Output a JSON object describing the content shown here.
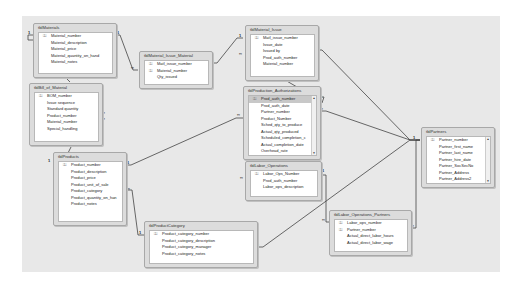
{
  "diagram": {
    "colors": {
      "background": "#e8e8e8",
      "table_frame": "#dcdcdc",
      "table_body": "#ffffff",
      "line": "#444444",
      "selected_field": "#c8c8c8"
    },
    "tables": [
      {
        "id": "tblMaterials",
        "title": "tblMaterials",
        "fields": [
          {
            "name": "Material_number",
            "pk": true
          },
          {
            "name": "Material_description",
            "pk": false
          },
          {
            "name": "Material_price",
            "pk": false
          },
          {
            "name": "Material_quantity_on_hand",
            "pk": false
          },
          {
            "name": "Material_notes",
            "pk": false
          }
        ]
      },
      {
        "id": "tblMaterial_Issue_Material",
        "title": "tblMaterial_Issue_Material",
        "fields": [
          {
            "name": "Matl_issue_number",
            "pk": true
          },
          {
            "name": "Material_number",
            "pk": true
          },
          {
            "name": "Qty_issued",
            "pk": false
          }
        ]
      },
      {
        "id": "tblMaterial_Issue",
        "title": "tblMaterial_Issue",
        "fields": [
          {
            "name": "Matl_issue_number",
            "pk": true
          },
          {
            "name": "Issue_date",
            "pk": false
          },
          {
            "name": "Issued by",
            "pk": false
          },
          {
            "name": "Prod_auth_number",
            "pk": false
          },
          {
            "name": "Material_number",
            "pk": false
          }
        ]
      },
      {
        "id": "tblBill_of_Material",
        "title": "tblBill_of_Material",
        "fields": [
          {
            "name": "BOM_number",
            "pk": true
          },
          {
            "name": "Issue sequence",
            "pk": false
          },
          {
            "name": "Standard quantity",
            "pk": false
          },
          {
            "name": "Product_number",
            "pk": false
          },
          {
            "name": "Material_number",
            "pk": false
          },
          {
            "name": "Special_handling",
            "pk": false
          }
        ]
      },
      {
        "id": "tblProduction_Authorizations",
        "title": "tblProduction_Authorizations",
        "scrollable": true,
        "fields": [
          {
            "name": "Prod_auth_number",
            "pk": true,
            "selected": true
          },
          {
            "name": "Prod_auth_date",
            "pk": false
          },
          {
            "name": "Partner_number",
            "pk": false
          },
          {
            "name": "Product_Number",
            "pk": false
          },
          {
            "name": "Sched_qty_to_produce",
            "pk": false
          },
          {
            "name": "Actual_qty_produced",
            "pk": false
          },
          {
            "name": "Scheduled_completion_c",
            "pk": false
          },
          {
            "name": "Actual_completion_date",
            "pk": false
          },
          {
            "name": "Overhead_rate",
            "pk": false
          }
        ]
      },
      {
        "id": "tblProducts",
        "title": "tblProducts",
        "fields": [
          {
            "name": "Product_number",
            "pk": true
          },
          {
            "name": "Product_description",
            "pk": false
          },
          {
            "name": "Product_price",
            "pk": false
          },
          {
            "name": "Product_unit_of_sale",
            "pk": false
          },
          {
            "name": "Product_category",
            "pk": false
          },
          {
            "name": "Product_quantity_on_han",
            "pk": false
          },
          {
            "name": "Product_notes",
            "pk": false
          }
        ]
      },
      {
        "id": "tblLabor_Operations",
        "title": "tblLabor_Operations",
        "fields": [
          {
            "name": "Labor_Ops_Number",
            "pk": true
          },
          {
            "name": "Prod_auth_number",
            "pk": false
          },
          {
            "name": "Labor_ops_description",
            "pk": false
          }
        ]
      },
      {
        "id": "tblPartners",
        "title": "tblPartners",
        "scrollable": true,
        "fields": [
          {
            "name": "Partner_number",
            "pk": true
          },
          {
            "name": "Partner_first_name",
            "pk": false
          },
          {
            "name": "Partner_last_name",
            "pk": false
          },
          {
            "name": "Partner_hire_date",
            "pk": false
          },
          {
            "name": "Partner_SocSecNo",
            "pk": false
          },
          {
            "name": "Partner_Address",
            "pk": false
          },
          {
            "name": "Partner_Address2",
            "pk": false
          }
        ]
      },
      {
        "id": "tblProductCategory",
        "title": "tblProductCategory",
        "fields": [
          {
            "name": "Product_category_number",
            "pk": true
          },
          {
            "name": "Product_category_description",
            "pk": false
          },
          {
            "name": "Product_category_manager",
            "pk": false
          },
          {
            "name": "Product_category_notes",
            "pk": false
          }
        ]
      },
      {
        "id": "tblLabor_Operations_Partners",
        "title": "tblLabor_Operations_Partners",
        "fields": [
          {
            "name": "Labor_ops_number",
            "pk": true
          },
          {
            "name": "Partner_number",
            "pk": true
          },
          {
            "name": "Actual_direct_labor_hours",
            "pk": false
          },
          {
            "name": "Actual_direct_labor_wage",
            "pk": false
          }
        ]
      }
    ],
    "cardinality": {
      "one": "1",
      "many": "∞"
    },
    "key_glyph": "🔑",
    "scroll_up": "▲",
    "scroll_down": "▼"
  }
}
